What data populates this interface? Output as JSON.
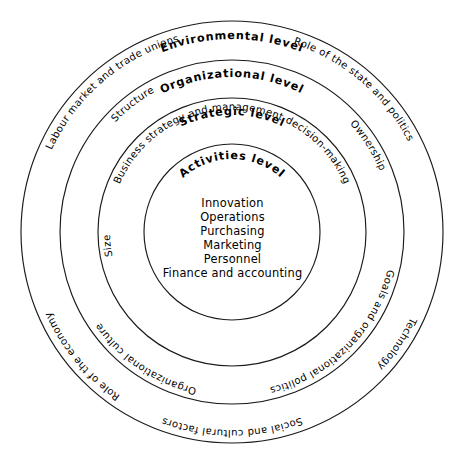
{
  "diagram": {
    "type": "concentric-rings",
    "center": {
      "x": 232,
      "y": 232
    },
    "stroke_color": "#1a1a1a",
    "background_color": "#ffffff",
    "rings": [
      {
        "id": "environmental",
        "level_label": "Environmental level",
        "radius": 211,
        "factors": [
          "Labour market and trade unions",
          "Role of the state and politics",
          "Role of the economy",
          "Social and cultural factors"
        ]
      },
      {
        "id": "organizational",
        "level_label": "Organizational level",
        "radius": 172,
        "factors": [
          "Structure",
          "Ownership",
          "Organizational culture",
          "Technology"
        ]
      },
      {
        "id": "strategic",
        "level_label": "Strategic level",
        "radius": 134,
        "factors": [
          "Business strategy and management decision-making",
          "Goals and organizational politics",
          "Size"
        ]
      },
      {
        "id": "activities",
        "level_label": "Activities level",
        "radius": 88,
        "items": [
          "Innovation",
          "Operations",
          "Purchasing",
          "Marketing",
          "Personnel",
          "Finance and accounting"
        ]
      }
    ]
  },
  "labels": {
    "environmental_level": "Environmental level",
    "organizational_level": "Organizational level",
    "strategic_level": "Strategic level",
    "activities_level": "Activities level",
    "labour_market": "Labour market and trade unions",
    "role_of_state": "Role of the state and politics",
    "role_of_economy": "Role of the economy",
    "social_cultural": "Social and cultural factors",
    "structure": "Structure",
    "ownership": "Ownership",
    "organizational_culture": "Organizational culture",
    "technology": "Technology",
    "business_strategy": "Business strategy and management decision-making",
    "goals_politics": "Goals and organizational politics",
    "size": "Size",
    "innovation": "Innovation",
    "operations": "Operations",
    "purchasing": "Purchasing",
    "marketing": "Marketing",
    "personnel": "Personnel",
    "finance_accounting": "Finance and accounting"
  }
}
